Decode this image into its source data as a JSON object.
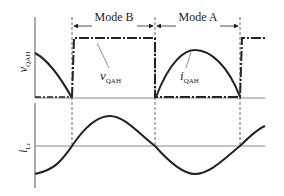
{
  "diagram": {
    "top_panel": {
      "ylabel": "v",
      "ylabel_sub": "QAH",
      "annotations": [
        {
          "text": "v",
          "sub": "QAH",
          "refers_to": "voltage-square-wave"
        },
        {
          "text": "i",
          "sub": "QAH",
          "refers_to": "current-half-sine"
        }
      ]
    },
    "bottom_panel": {
      "ylabel": "i",
      "ylabel_sub": "Lr"
    },
    "modes": [
      {
        "label": "Mode B",
        "span": "first-to-second-boundary"
      },
      {
        "label": "Mode A",
        "span": "second-to-third-boundary"
      }
    ],
    "colors": {
      "ink": "#222222",
      "axis": "#555555",
      "grid": "#888888"
    }
  }
}
